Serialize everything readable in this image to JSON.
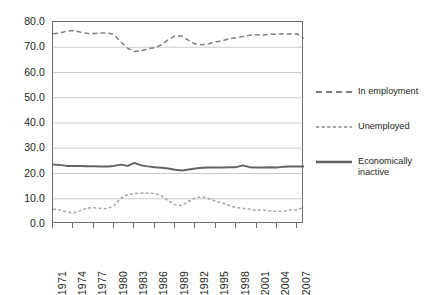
{
  "chart_data": {
    "type": "line",
    "title": "",
    "subtitle": "",
    "xlabel": "",
    "ylabel": "",
    "xlim": [
      1971,
      2008
    ],
    "ylim": [
      0.0,
      80.0
    ],
    "grid": true,
    "grid_axis": "y",
    "legend_position": "right",
    "x_tick_labels": [
      "1971",
      "1974",
      "1977",
      "1980",
      "1983",
      "1986",
      "1989",
      "1992",
      "1995",
      "1998",
      "2001",
      "2004",
      "2007"
    ],
    "y_tick_labels": [
      "0.0",
      "10.0",
      "20.0",
      "30.0",
      "40.0",
      "50.0",
      "60.0",
      "70.0",
      "80.0"
    ],
    "y_ticks": [
      0.0,
      10.0,
      20.0,
      30.0,
      40.0,
      50.0,
      60.0,
      70.0,
      80.0
    ],
    "x": [
      1971,
      1972,
      1973,
      1974,
      1975,
      1976,
      1977,
      1978,
      1979,
      1980,
      1981,
      1982,
      1983,
      1984,
      1985,
      1986,
      1987,
      1988,
      1989,
      1990,
      1991,
      1992,
      1993,
      1994,
      1995,
      1996,
      1997,
      1998,
      1999,
      2000,
      2001,
      2002,
      2003,
      2004,
      2005,
      2006,
      2007,
      2008
    ],
    "series": [
      {
        "name": "In employment",
        "style": "dashed",
        "color": "#808080",
        "values": [
          75.3,
          75.6,
          76.4,
          76.6,
          76.0,
          75.5,
          75.4,
          75.6,
          75.7,
          75.0,
          72.1,
          69.6,
          68.3,
          68.6,
          69.4,
          69.8,
          71.0,
          73.0,
          74.5,
          74.4,
          72.7,
          71.3,
          71.0,
          71.5,
          72.1,
          72.6,
          73.4,
          73.8,
          74.3,
          74.8,
          75.0,
          74.9,
          75.1,
          75.2,
          75.3,
          75.2,
          75.3,
          73.5
        ]
      },
      {
        "name": "Unemployed",
        "style": "dotted",
        "color": "#a6a6a6",
        "values": [
          5.8,
          5.6,
          4.7,
          4.4,
          5.2,
          6.3,
          6.4,
          6.2,
          6.0,
          7.3,
          10.2,
          11.6,
          12.0,
          12.3,
          12.2,
          12.1,
          11.2,
          9.2,
          7.6,
          7.3,
          9.0,
          10.4,
          10.8,
          10.0,
          9.0,
          8.3,
          7.3,
          6.5,
          6.2,
          5.8,
          5.4,
          5.5,
          5.2,
          4.9,
          5.0,
          5.5,
          5.5,
          6.8
        ]
      },
      {
        "name": "Economically\ninactive",
        "style": "solid",
        "color": "#636363",
        "values": [
          23.5,
          23.4,
          23.0,
          23.0,
          23.0,
          22.9,
          22.9,
          22.8,
          22.8,
          23.0,
          23.5,
          23.0,
          24.2,
          23.2,
          22.8,
          22.5,
          22.3,
          22.0,
          21.5,
          21.2,
          21.6,
          22.0,
          22.3,
          22.4,
          22.4,
          22.4,
          22.5,
          22.5,
          23.2,
          22.5,
          22.4,
          22.4,
          22.5,
          22.4,
          22.7,
          22.8,
          22.8,
          22.8
        ]
      }
    ],
    "legend": [
      {
        "label": "In employment",
        "style": "dashed",
        "color": "#808080"
      },
      {
        "label": "Unemployed",
        "style": "dotted",
        "color": "#a6a6a6"
      },
      {
        "label": "Economically\ninactive",
        "style": "solid",
        "color": "#636363"
      }
    ],
    "colors": {
      "in_employment": "#808080",
      "unemployed": "#a6a6a6",
      "economically_inactive": "#636363",
      "gridline": "#bfbfbf",
      "frame": "#6f6f6f",
      "text": "#231f20",
      "background": "#ffffff"
    }
  }
}
